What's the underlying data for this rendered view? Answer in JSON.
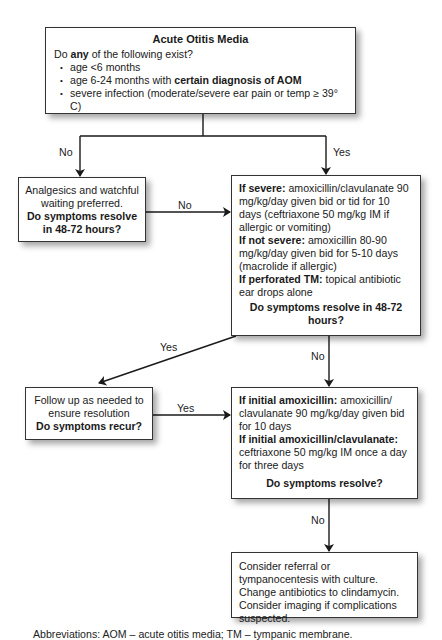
{
  "top_box": {
    "title": "Acute Otitis Media",
    "question_prefix": "Do ",
    "question_bold": "any",
    "question_suffix": " of the following exist?",
    "criteria": [
      {
        "text": "age <6 months",
        "bold": ""
      },
      {
        "text": "age 6-24 months with ",
        "bold": "certain diagnosis of AOM"
      },
      {
        "text": "severe infection (moderate/severe ear pain or temp ≥ 39° C)",
        "bold": ""
      }
    ]
  },
  "branch_labels": {
    "top_no": "No",
    "top_yes": "Yes",
    "left_to_right_no": "No",
    "right1_yes": "Yes",
    "right1_no": "No",
    "followup_yes": "Yes",
    "right2_no": "No"
  },
  "left_box": {
    "line1": "Analgesics and watchful waiting preferred.",
    "question": "Do symptoms resolve in 48-72 hours?"
  },
  "right_box_1": {
    "severe_label": "If severe:",
    "severe_text": " amoxicillin/clavulanate 90 mg/kg/day given bid or tid for 10 days (ceftriaxone 50 mg/kg IM if allergic or vomiting)",
    "not_severe_label": "If not severe:",
    "not_severe_text": " amoxicillin 80-90 mg/kg/day given bid for 5-10 days (macrolide if allergic)",
    "perforated_label": "If perforated TM:",
    "perforated_text": "  topical antibiotic ear drops alone",
    "question": "Do symptoms resolve in 48-72 hours?"
  },
  "followup_box": {
    "line1": "Follow up as needed to ensure resolution",
    "question": "Do symptoms recur?"
  },
  "right_box_2": {
    "initial_amox_label": "If initial amoxicillin:",
    "initial_amox_text": " amoxicillin/ clavulanate 90 mg/kg/day given bid for 10 days",
    "initial_amoxclav_label": "If initial amoxicillin/clavulanate:",
    "initial_amoxclav_text": " ceftriaxone 50 mg/kg IM once a day for three days",
    "question": "Do symptoms resolve?"
  },
  "final_box": {
    "text": "Consider referral or tympanocentesis with culture. Change antibiotics to clindamycin. Consider imaging if complications suspected."
  },
  "footer": {
    "text": "Abbreviations: AOM – acute otitis media; TM – tympanic membrane."
  },
  "colors": {
    "line": "#1a1a1a",
    "border": "#333333",
    "background": "#ffffff"
  }
}
